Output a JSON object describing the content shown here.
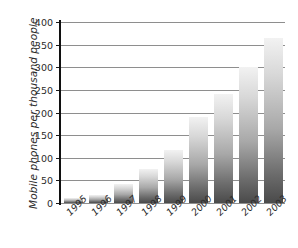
{
  "chart_data": {
    "type": "bar",
    "title": "",
    "subtitle": "",
    "xlabel": "",
    "ylabel": "Mobile phones per thousand people",
    "categories": [
      "1995",
      "1996",
      "1997",
      "1998",
      "1999",
      "2000",
      "2001",
      "2002",
      "2003"
    ],
    "values": [
      11,
      18,
      43,
      75,
      118,
      190,
      240,
      300,
      365
    ],
    "series": [
      {
        "name": "Mobile phones per thousand people",
        "values": [
          11,
          18,
          43,
          75,
          118,
          190,
          240,
          300,
          365
        ]
      }
    ],
    "ylim": [
      0,
      400
    ],
    "y_ticks": [
      0,
      50,
      100,
      150,
      200,
      250,
      300,
      350,
      400
    ],
    "y_tick_labels": [
      "0",
      "50",
      "100",
      "150",
      "200",
      "250",
      "300",
      "350",
      "400"
    ],
    "grid": true,
    "grid_axis": "y",
    "legend": false,
    "legend_position": "none",
    "annotations": [],
    "bar_fill": "vertical-gradient-light-to-dark",
    "colors": {
      "background": "#ffffff",
      "axis": "#101010",
      "gridline": "#8e8e8e",
      "text": "#2b2b2b",
      "bar_top": "#f2f2f2",
      "bar_bottom": "#4a4a4a"
    }
  }
}
